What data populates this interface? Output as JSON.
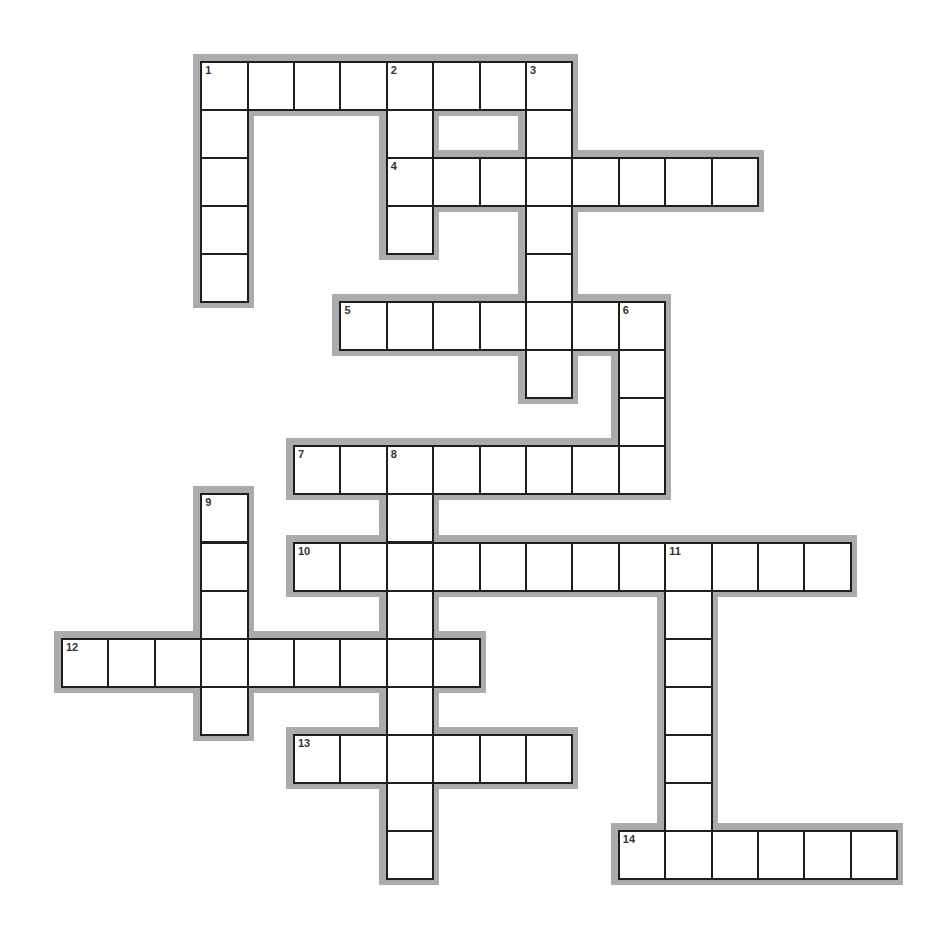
{
  "puzzle": {
    "type": "crossword",
    "grid": {
      "origin_x": 61,
      "origin_y": 61,
      "cell_width": 46.4,
      "cell_height": 48.05,
      "halo_pad": 7
    },
    "colors": {
      "halo": "#ababab",
      "cell_border": "#1e1e1e",
      "cell_fill": "#ffffff",
      "number": "#333333"
    },
    "entries": [
      {
        "number": "1",
        "direction": "across",
        "row": 0,
        "col": 3,
        "length": 8,
        "answer": ""
      },
      {
        "number": "1",
        "direction": "down",
        "row": 0,
        "col": 3,
        "length": 5,
        "answer": ""
      },
      {
        "number": "2",
        "direction": "down",
        "row": 0,
        "col": 7,
        "length": 4,
        "answer": ""
      },
      {
        "number": "3",
        "direction": "down",
        "row": 0,
        "col": 10,
        "length": 7,
        "answer": ""
      },
      {
        "number": "4",
        "direction": "across",
        "row": 2,
        "col": 7,
        "length": 8,
        "answer": ""
      },
      {
        "number": "5",
        "direction": "across",
        "row": 5,
        "col": 6,
        "length": 7,
        "answer": ""
      },
      {
        "number": "6",
        "direction": "down",
        "row": 5,
        "col": 12,
        "length": 4,
        "answer": ""
      },
      {
        "number": "7",
        "direction": "across",
        "row": 8,
        "col": 5,
        "length": 8,
        "answer": ""
      },
      {
        "number": "8",
        "direction": "down",
        "row": 8,
        "col": 7,
        "length": 9,
        "answer": ""
      },
      {
        "number": "9",
        "direction": "down",
        "row": 9,
        "col": 3,
        "length": 5,
        "answer": ""
      },
      {
        "number": "10",
        "direction": "across",
        "row": 10,
        "col": 5,
        "length": 12,
        "answer": ""
      },
      {
        "number": "11",
        "direction": "down",
        "row": 10,
        "col": 13,
        "length": 7,
        "answer": ""
      },
      {
        "number": "12",
        "direction": "across",
        "row": 12,
        "col": 0,
        "length": 9,
        "answer": ""
      },
      {
        "number": "13",
        "direction": "across",
        "row": 14,
        "col": 5,
        "length": 6,
        "answer": ""
      },
      {
        "number": "14",
        "direction": "across",
        "row": 16,
        "col": 12,
        "length": 6,
        "answer": ""
      }
    ]
  }
}
